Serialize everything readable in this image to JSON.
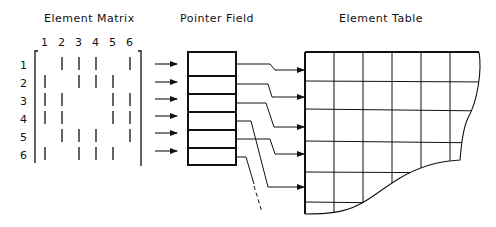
{
  "titles": {
    "matrix": "Element Matrix",
    "pointer": "Pointer Field",
    "table": "Element Table"
  },
  "matrix": {
    "column_labels": [
      "1",
      "2",
      "3",
      "4",
      "5",
      "6"
    ],
    "row_labels": [
      "1",
      "2",
      "3",
      "4",
      "5",
      "6"
    ],
    "nonzero_entries": [
      [
        0,
        1,
        1,
        1,
        0,
        1
      ],
      [
        1,
        0,
        1,
        1,
        1,
        0
      ],
      [
        1,
        1,
        0,
        0,
        1,
        1
      ],
      [
        1,
        1,
        0,
        0,
        1,
        1
      ],
      [
        0,
        1,
        1,
        1,
        0,
        1
      ],
      [
        1,
        0,
        1,
        1,
        1,
        0
      ]
    ]
  },
  "pointer_field": {
    "cells": 6,
    "targets_table_row_y": [
      70,
      97,
      127,
      187,
      154,
      null
    ]
  },
  "element_table": {
    "columns": 6,
    "rows": 6,
    "edge": "irregular torn lower-right"
  },
  "colors": {
    "ink": "#111111",
    "background": "#ffffff"
  }
}
